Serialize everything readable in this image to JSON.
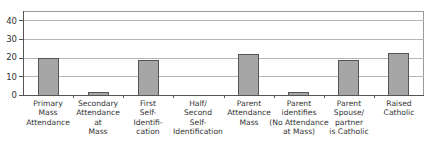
{
  "chart_data": {
    "type": "bar",
    "title": "",
    "xlabel": "",
    "ylabel": "",
    "ylim": [
      0,
      45
    ],
    "yticks": [
      0,
      10,
      20,
      30,
      40
    ],
    "grid": true,
    "legend": null,
    "categories": [
      "Primary\nMass\nAttendance",
      "Secondary\nAttendance\nat\nMass",
      "First\nSelf-\nIdentifi-\ncation",
      "Half/\nSecond\nSelf-\nIdentification",
      "Parent\nAttendance\nMass",
      "Parent\nidentifies\n(No Attendance\nat Mass)",
      "Parent\nSpouse/\npartner\nis Catholic",
      "Raised\nCatholic"
    ],
    "values": [
      20.5,
      2,
      19,
      0,
      22.5,
      2,
      19.5,
      23
    ],
    "bar_color": "#a6a6a6",
    "bar_edge_color": "#555555"
  },
  "yaxis": {
    "ticks": [
      "0",
      "10",
      "20",
      "30",
      "40"
    ]
  }
}
